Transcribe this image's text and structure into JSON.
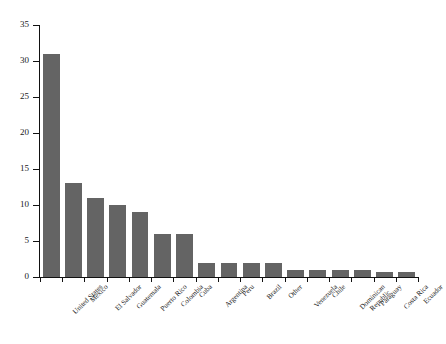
{
  "chart_data": {
    "type": "bar",
    "title": "",
    "subtitle": "",
    "xlabel": "",
    "ylabel": "",
    "ylim": [
      0,
      35
    ],
    "yticks": [
      0,
      5,
      10,
      15,
      20,
      25,
      30,
      35
    ],
    "grid": false,
    "legend": false,
    "bar_color": "#646464",
    "axis_color": "#111111",
    "background_color": "#ffffff",
    "label_rotation_degrees": -45,
    "categories": [
      "United States",
      "Mexico",
      "El Salvador",
      "Guatemala",
      "Puerto Rico",
      "Colombia",
      "Cuba",
      "Argentina",
      "Peru",
      "Brazil",
      "Other",
      "Venezuela",
      "Chile",
      "Dominican Republic",
      "Paraguay",
      "Costa Rica",
      "Ecuador"
    ],
    "category_label_lines": [
      [
        "United States"
      ],
      [
        "Mexico"
      ],
      [
        "El Salvador"
      ],
      [
        "Guatemala"
      ],
      [
        "Puerto Rico"
      ],
      [
        "Colombia"
      ],
      [
        "Cuba"
      ],
      [
        "Argentina"
      ],
      [
        "Peru"
      ],
      [
        "Brazil"
      ],
      [
        "Other"
      ],
      [
        "Venezuela"
      ],
      [
        "Chile"
      ],
      [
        "Dominican",
        "Republic"
      ],
      [
        "Paraguay"
      ],
      [
        "Costa Rica"
      ],
      [
        "Ecuador"
      ]
    ],
    "values": [
      31,
      13,
      11,
      10,
      9,
      6,
      6,
      2,
      2,
      2,
      2,
      1,
      1,
      1,
      1,
      0.7,
      0.7
    ]
  }
}
